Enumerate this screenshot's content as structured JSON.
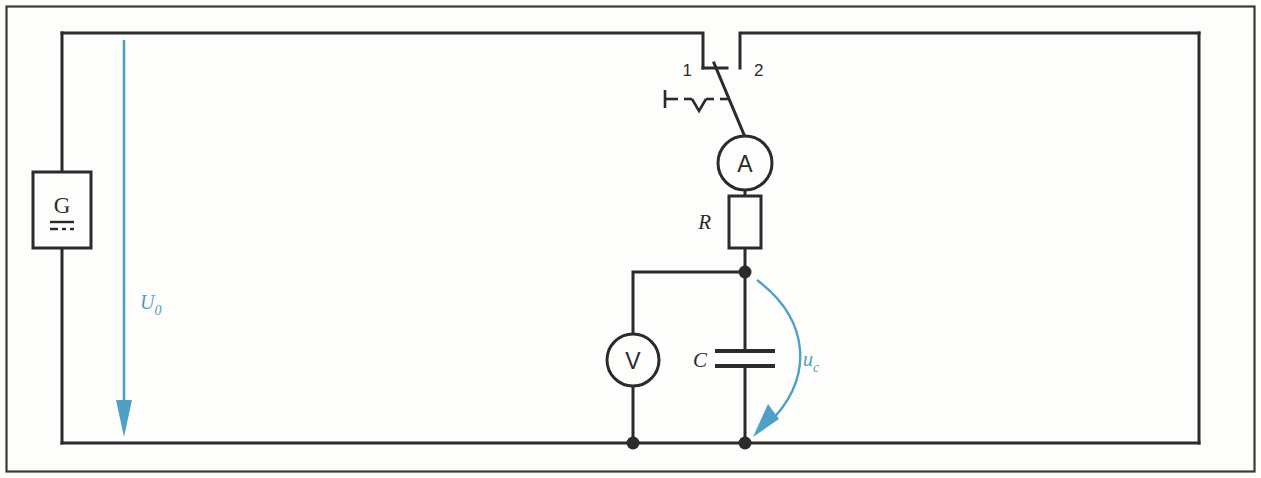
{
  "figure": {
    "colors": {
      "wire": "#2b2b2b",
      "frame": "#3a3a38",
      "background": "#fdfdfb",
      "annotation_blue": "#4f9fc6",
      "component_fill": "#fdfdfb"
    }
  },
  "components": {
    "source": {
      "name": "G",
      "dc_symbol": "direct-current-bars",
      "label": "G"
    },
    "switch": {
      "contact_1_label": "1",
      "contact_2_label": "2",
      "actuator": "manual-operation-dashed"
    },
    "ammeter": {
      "label": "A"
    },
    "resistor": {
      "label": "R"
    },
    "capacitor": {
      "label": "C"
    },
    "voltmeter": {
      "label": "V"
    }
  },
  "annotations": {
    "source_voltage": {
      "symbol": "U",
      "subscript": "0",
      "direction": "down"
    },
    "capacitor_voltage": {
      "symbol": "u",
      "subscript": "c",
      "direction": "down-curved"
    }
  }
}
